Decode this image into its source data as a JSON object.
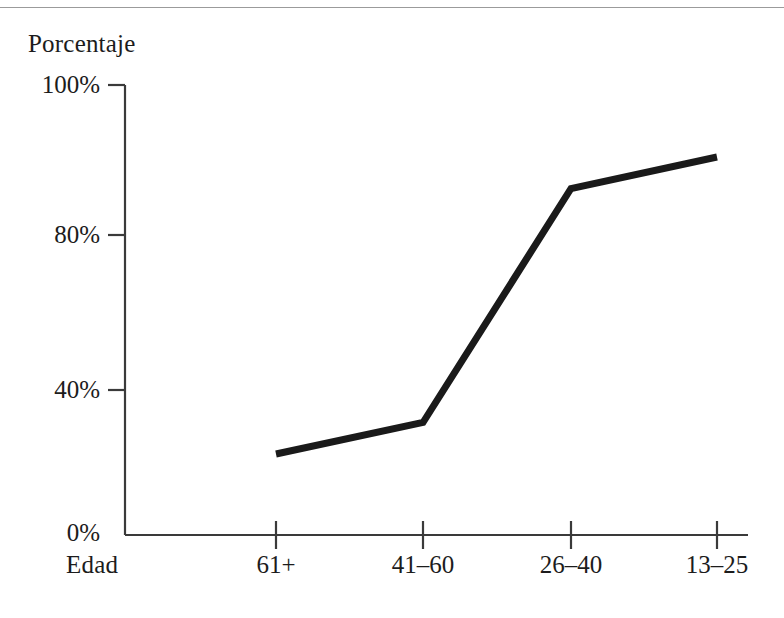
{
  "chart_data": {
    "type": "line",
    "title": "",
    "xlabel": "Edad",
    "ylabel": "Porcentaje",
    "categories": [
      "61+",
      "41–60",
      "26–40",
      "13–25"
    ],
    "values": [
      18,
      25,
      77,
      84
    ],
    "series": [
      {
        "name": "Porcentaje",
        "values": [
          18,
          25,
          77,
          84
        ]
      }
    ],
    "ylim": [
      0,
      100
    ],
    "yticks": [
      0,
      40,
      80,
      100
    ],
    "ytick_labels": [
      "0%",
      "40%",
      "80%",
      "100%"
    ],
    "grid": false,
    "legend": false,
    "legend_position": "none",
    "line_color": "#1a1a1a",
    "line_width": 7,
    "background_color": "#ffffff"
  },
  "axes": {
    "y_title": "Porcentaje",
    "x_title": "Edad",
    "y_labels": {
      "t100": "100%",
      "t80": "80%",
      "t40": "40%",
      "t0": "0%"
    },
    "x_labels": {
      "c0": "61+",
      "c1": "41–60",
      "c2": "26–40",
      "c3": "13–25"
    }
  }
}
